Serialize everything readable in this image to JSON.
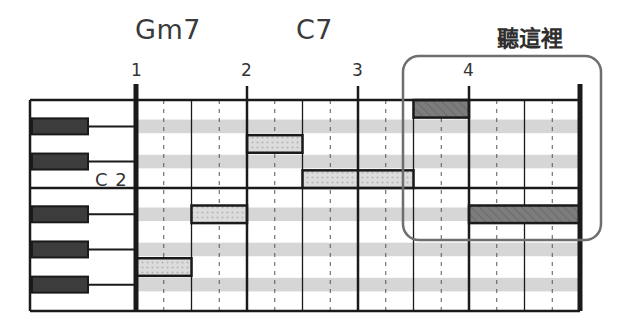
{
  "title_labels": {
    "chords": [
      {
        "label": "Gm7",
        "bar": 1
      },
      {
        "label": "C7",
        "bar": 2
      }
    ],
    "callout_label": "聽這裡"
  },
  "bar_numbers": [
    "1",
    "2",
    "3",
    "4"
  ],
  "keyboard": {
    "octave_label": "C 2",
    "rows_top_to_bottom": [
      "E",
      "D#",
      "D",
      "C#",
      "C",
      "B",
      "A#",
      "A",
      "G#",
      "G",
      "F#",
      "F"
    ]
  },
  "grid": {
    "bars": 4,
    "beats_per_bar": 4,
    "colors": {
      "line": "#1a1a1a",
      "black_key_stripe": "#d6d6d6",
      "dotted_note_fill": "#d0d0d0",
      "hatched_note_fill": "#7a7a7a",
      "callout_border": "#6e6e6e",
      "black_key": "#3c3c3c"
    }
  },
  "notes": [
    {
      "pitch": "G",
      "start_beat": 0,
      "length_beats": 2,
      "style": "dotted"
    },
    {
      "pitch": "A#",
      "start_beat": 2,
      "length_beats": 2,
      "style": "dotted"
    },
    {
      "pitch": "D",
      "start_beat": 4,
      "length_beats": 2,
      "style": "dotted"
    },
    {
      "pitch": "C",
      "start_beat": 6,
      "length_beats": 4,
      "style": "dotted"
    },
    {
      "pitch": "E",
      "start_beat": 10,
      "length_beats": 2,
      "style": "hatched"
    },
    {
      "pitch": "A#",
      "start_beat": 12,
      "length_beats": 4,
      "style": "hatched"
    }
  ]
}
